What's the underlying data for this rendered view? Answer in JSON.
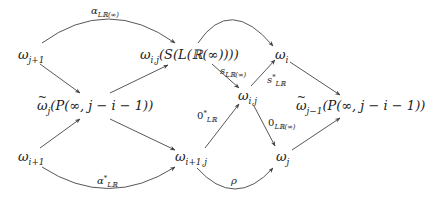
{
  "diagram": {
    "type": "commutative-diagram",
    "colors": {
      "background": "#ffffff",
      "text": "#222222",
      "edge": "#444444"
    },
    "nodes": [
      {
        "id": "w_j1",
        "text": "ω_{j+1}",
        "base": "ω",
        "sub": "j+1",
        "rest": ""
      },
      {
        "id": "w_ij_S",
        "text": "ω_{i,j}(S(L(ℝ(∞))))",
        "base": "ω",
        "sub": "i,j",
        "rest": "(S(L(ℝ(∞))))"
      },
      {
        "id": "w_i",
        "text": "ω_i",
        "base": "ω",
        "sub": "i",
        "rest": ""
      },
      {
        "id": "wt_j",
        "text": "ω̃_j(P(∞, j − i − 1))",
        "base": "ω",
        "sub": "j",
        "rest": "(P(∞, j − i − 1))"
      },
      {
        "id": "w_ij",
        "text": "ω_{i,j}",
        "base": "ω",
        "sub": "i,j",
        "rest": ""
      },
      {
        "id": "wt_jm1",
        "text": "ω̃_{j−1}(P(∞, j − i − 1))",
        "base": "ω",
        "sub": "j−1",
        "rest": "(P(∞, j − i − 1))"
      },
      {
        "id": "w_i1",
        "text": "ω_{i+1}",
        "base": "ω",
        "sub": "i+1",
        "rest": ""
      },
      {
        "id": "w_i1j",
        "text": "ω_{i+1,j}",
        "base": "ω",
        "sub": "i+1,j",
        "rest": ""
      },
      {
        "id": "w_j",
        "text": "ω_j",
        "base": "ω",
        "sub": "j",
        "rest": ""
      }
    ],
    "edge_labels": {
      "alpha_LRinf": {
        "base": "α",
        "sub": "LℝR(∞)",
        "sup": "",
        "text": "α_{Lℝ(∞)}"
      },
      "s_LRinf": {
        "base": "s",
        "sub": "Lℝ(∞)",
        "sup": "",
        "text": "s_{Lℝ(∞)}"
      },
      "s_star_LR": {
        "base": "s",
        "sub": "Lℝ",
        "sup": "*",
        "text": "s*_{Lℝ}"
      },
      "zero_star_LR": {
        "base": "0",
        "sub": "Lℝ",
        "sup": "*",
        "text": "0*_{Lℝ}"
      },
      "zero_LRinf": {
        "base": "0",
        "sub": "Lℝ(∞)",
        "sup": "",
        "text": "0_{Lℝ(∞)}"
      },
      "alpha_star_LR": {
        "base": "α",
        "sub": "Lℝ",
        "sup": "*",
        "text": "α*_{Lℝ}"
      },
      "rho": {
        "base": "ρ",
        "sub": "",
        "sup": "",
        "text": "ρ"
      }
    },
    "edges": [
      {
        "from": "w_j1",
        "to": "w_ij_S",
        "label": "α_{Lℝ(∞)}",
        "curved": true
      },
      {
        "from": "w_j1",
        "to": "wt_j",
        "label": ""
      },
      {
        "from": "wt_j",
        "to": "w_ij_S",
        "label": ""
      },
      {
        "from": "w_ij_S",
        "to": "w_i",
        "label": "",
        "curved": true
      },
      {
        "from": "w_ij_S",
        "to": "w_ij",
        "label": "s_{Lℝ(∞)}"
      },
      {
        "from": "w_ij",
        "to": "w_i",
        "label": "s*_{Lℝ}"
      },
      {
        "from": "w_i",
        "to": "wt_jm1",
        "label": ""
      },
      {
        "from": "w_i1",
        "to": "wt_j",
        "label": ""
      },
      {
        "from": "wt_j",
        "to": "w_i1j",
        "label": ""
      },
      {
        "from": "w_i1",
        "to": "w_i1j",
        "label": "α*_{Lℝ}",
        "curved": true
      },
      {
        "from": "w_i1j",
        "to": "w_ij",
        "label": "0*_{Lℝ}"
      },
      {
        "from": "w_ij",
        "to": "w_j",
        "label": "0_{Lℝ(∞)}"
      },
      {
        "from": "w_i1j",
        "to": "w_j",
        "label": "ρ",
        "curved": true
      },
      {
        "from": "w_j",
        "to": "wt_jm1",
        "label": ""
      }
    ]
  },
  "text": {
    "omega": "ω",
    "n_w_j1_sub": "j+1",
    "n_w_ijS_sub": "i,j",
    "n_w_ijS_rest": "(S(L(ℝ(∞))))",
    "n_w_i_sub": "i",
    "n_wt_j_sub": "j",
    "n_wt_j_rest": "(P(∞, j − i − 1))",
    "n_w_ij_sub": "i,j",
    "n_wt_jm1_sub": "j−1",
    "n_wt_jm1_rest": "(P(∞, j − i − 1))",
    "n_w_i1_sub": "i+1",
    "n_w_i1j_sub": "i+1,j",
    "n_w_j_sub": "j",
    "l_alpha": "α",
    "l_alpha_sub": "Lℝ(∞)",
    "l_s": "s",
    "l_s_sub": "Lℝ(∞)",
    "l_sstar": "s",
    "l_sstar_sup": "*",
    "l_sstar_sub": "Lℝ",
    "l_zstar": "0",
    "l_zstar_sup": "*",
    "l_zstar_sub": "Lℝ",
    "l_z": "0",
    "l_z_sub": "Lℝ(∞)",
    "l_astar": "α",
    "l_astar_sup": "*",
    "l_astar_sub": "Lℝ",
    "l_rho": "ρ"
  }
}
